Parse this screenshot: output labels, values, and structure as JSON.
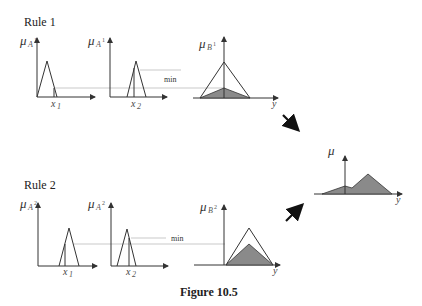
{
  "rule1": {
    "title": "Rule 1",
    "plot1": {
      "mu": "μ",
      "sub": "A",
      "subidx": "1",
      "sup": "1",
      "x_label": "x",
      "x_sub": "1"
    },
    "plot2": {
      "mu": "μ",
      "sub": "A",
      "subidx": "2",
      "sup": "1",
      "x_label": "x",
      "x_sub": "2"
    },
    "plot3": {
      "mu": "μ",
      "sub": "B",
      "sup": "1",
      "y_label": "y"
    },
    "min_label": "min"
  },
  "rule2": {
    "title": "Rule 2",
    "plot1": {
      "mu": "μ",
      "sub": "A",
      "subidx": "1",
      "sup": "2",
      "x_label": "x",
      "x_sub": "1"
    },
    "plot2": {
      "mu": "μ",
      "sub": "A",
      "subidx": "2",
      "sup": "2",
      "x_label": "x",
      "x_sub": "2"
    },
    "plot3": {
      "mu": "μ",
      "sub": "B",
      "sup": "2",
      "y_label": "y"
    },
    "min_label": "min"
  },
  "aggregate": {
    "mu": "μ",
    "y_label": "y"
  },
  "caption": "Figure 10.5",
  "colors": {
    "shade": "#8a8a8a",
    "line": "#333333",
    "guide": "#bbbbbb"
  }
}
